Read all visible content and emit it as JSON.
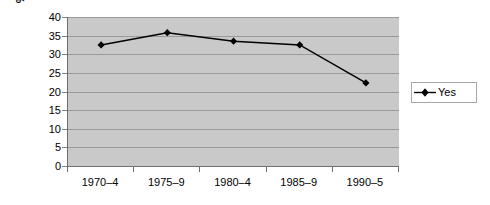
{
  "chart_data": {
    "type": "line",
    "title": "",
    "xlabel": "",
    "ylabel": "% observations",
    "categories": [
      "1970–4",
      "1975–9",
      "1980–4",
      "1985–9",
      "1990–5"
    ],
    "series": [
      {
        "name": "Yes",
        "values": [
          32.5,
          35.8,
          33.5,
          32.5,
          22.3
        ],
        "color": "#000000",
        "marker": "diamond"
      }
    ],
    "ylim": [
      0,
      40
    ],
    "ytick_step": 5,
    "yticks": [
      40,
      35,
      30,
      25,
      20,
      15,
      10,
      5,
      0
    ],
    "grid": "horizontal",
    "legend_position": "right",
    "plot_background": "#c9c9c9",
    "gridline_color": "#9a9a9a",
    "axis_color": "#6f6f6f",
    "figure_background": "#ffffff"
  },
  "legend": {
    "entries": [
      {
        "label": "Yes"
      }
    ]
  }
}
